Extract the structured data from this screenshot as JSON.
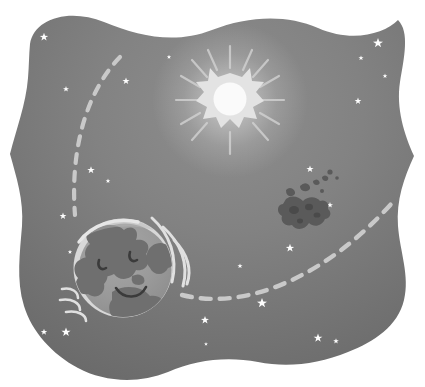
{
  "illustration": {
    "title": "Sleeping Earth in space with sun, asteroid and orbit paths",
    "alt_text": "Grayscale flat illustration of a smiling sleeping planet Earth in outer space, with a starburst sun, a drifting asteroid, dashed orbital paths and scattered stars, inside a wavy-edged panel",
    "style": "flat-vector-grayscale",
    "canvas": {
      "width": 425,
      "height": 387
    }
  },
  "palette": {
    "page_background": "#ffffff",
    "space_dark": "#6b6b6b",
    "space_mid": "#7d7d7d",
    "space_light": "#8e8e8e",
    "star_white": "#fdfdfd",
    "sun_core": "#fafafa",
    "sun_burst": "#e3e3e3",
    "sun_ray": "#d2d2d2",
    "earth_ocean": "#9a9a9a",
    "earth_ocean_light": "#aeaeae",
    "earth_land": "#6f6f6f",
    "earth_land_light": "#8a8a8a",
    "earth_rim": "#d8d8d8",
    "earth_face": "#3b3b3b",
    "asteroid_body": "#5a5a5a",
    "asteroid_crater": "#4a4a4a",
    "orbit_dash": "#c9c9c9",
    "swoosh": "#e0e0e0"
  },
  "panel": {
    "name": "wavy-space-panel",
    "shape": "organic wavy rounded rectangle",
    "fill_description": "radial gradient, lighter near the sun at top-center, darker at the outer edges"
  },
  "objects": {
    "sun": {
      "label": "Sun",
      "center": {
        "x": 230,
        "y": 100
      },
      "core_radius": 16,
      "burst_points": 8,
      "burst_radius": 27,
      "ray_count": 12,
      "ray_inner": 32,
      "ray_outer": 54
    },
    "earth": {
      "label": "Earth",
      "center": {
        "x": 123,
        "y": 268
      },
      "radius": 49,
      "expression": "sleeping, eyes closed, smiling",
      "has_rim_highlight": true,
      "motion_swooshes": 6
    },
    "asteroid": {
      "label": "Asteroid",
      "center": {
        "x": 302,
        "y": 212
      },
      "width": 46,
      "height": 30,
      "fragment_count": 7
    },
    "orbits": [
      {
        "name": "left-orbit-path",
        "style": "dashed",
        "dash": "9 9",
        "stroke_width": 4.2,
        "path": "M 120 57 C 86 92, 70 150, 75 215"
      },
      {
        "name": "right-orbit-path",
        "style": "dashed",
        "dash": "10 9",
        "stroke_width": 4.4,
        "path": "M 182 295 C 250 312, 330 272, 392 203"
      }
    ],
    "stars": [
      {
        "x": 44,
        "y": 37,
        "r": 4.2
      },
      {
        "x": 66,
        "y": 89,
        "r": 3.0
      },
      {
        "x": 126,
        "y": 81,
        "r": 3.6
      },
      {
        "x": 91,
        "y": 170,
        "r": 3.8
      },
      {
        "x": 108,
        "y": 181,
        "r": 2.4
      },
      {
        "x": 63,
        "y": 216,
        "r": 3.4
      },
      {
        "x": 70,
        "y": 252,
        "r": 2.2
      },
      {
        "x": 44,
        "y": 332,
        "r": 3.2
      },
      {
        "x": 66,
        "y": 332,
        "r": 4.6
      },
      {
        "x": 205,
        "y": 320,
        "r": 4.0
      },
      {
        "x": 262,
        "y": 303,
        "r": 5.0
      },
      {
        "x": 290,
        "y": 248,
        "r": 4.2
      },
      {
        "x": 240,
        "y": 266,
        "r": 2.6
      },
      {
        "x": 155,
        "y": 245,
        "r": 2.2
      },
      {
        "x": 318,
        "y": 338,
        "r": 4.4
      },
      {
        "x": 336,
        "y": 341,
        "r": 2.8
      },
      {
        "x": 341,
        "y": 362,
        "r": 3.0
      },
      {
        "x": 377,
        "y": 363,
        "r": 3.6
      },
      {
        "x": 378,
        "y": 43,
        "r": 5.0
      },
      {
        "x": 361,
        "y": 58,
        "r": 2.6
      },
      {
        "x": 385,
        "y": 76,
        "r": 2.4
      },
      {
        "x": 358,
        "y": 101,
        "r": 3.4
      },
      {
        "x": 296,
        "y": 204,
        "r": 3.0
      },
      {
        "x": 310,
        "y": 169,
        "r": 3.6
      },
      {
        "x": 330,
        "y": 205,
        "r": 3.0
      },
      {
        "x": 401,
        "y": 218,
        "r": 2.6
      },
      {
        "x": 169,
        "y": 57,
        "r": 2.2
      },
      {
        "x": 260,
        "y": 370,
        "r": 2.4
      },
      {
        "x": 206,
        "y": 344,
        "r": 2.0
      }
    ]
  }
}
